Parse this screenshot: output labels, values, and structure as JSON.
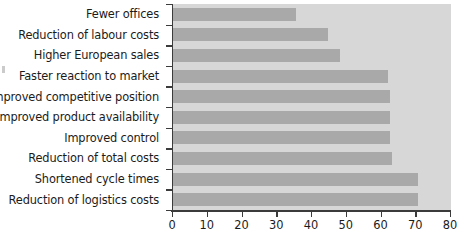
{
  "chart_data": {
    "type": "bar",
    "orientation": "horizontal",
    "title": "",
    "subtitle": "",
    "xlabel": "",
    "ylabel": "",
    "xlim": [
      0,
      80
    ],
    "xticks": [
      0,
      10,
      20,
      30,
      40,
      50,
      60,
      70,
      80
    ],
    "xticklabels": [
      "0",
      "10",
      "20",
      "30",
      "40",
      "50",
      "60",
      "70",
      "80"
    ],
    "grid": false,
    "legend": false,
    "legend_position": "none",
    "categories": [
      "Fewer offices",
      "Reduction of labour costs",
      "Higher European sales",
      "Faster reaction to market",
      "Improved competitive position",
      "Improved product availability",
      "Improved control",
      "Reduction of total costs",
      "Shortened cycle times",
      "Reduction of logistics costs"
    ],
    "values": [
      35.5,
      44.5,
      48,
      62,
      62.5,
      62.5,
      62.5,
      63,
      70.5,
      70.5
    ],
    "series": [
      {
        "name": "",
        "values": [
          35.5,
          44.5,
          48,
          62,
          62.5,
          62.5,
          62.5,
          63,
          70.5,
          70.5
        ]
      }
    ]
  },
  "colors": {
    "bar_fill": "#a9a9a9",
    "plot_background": "#d7d7d7",
    "axis_line": "#3b3b3b",
    "text": "#1b1b1b",
    "page_background": "#ffffff"
  }
}
